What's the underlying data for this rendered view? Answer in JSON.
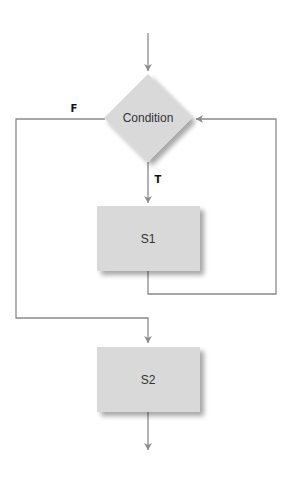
{
  "diagram": {
    "type": "flowchart",
    "title": "",
    "colors": {
      "node_fill": "#d9d9d9",
      "node_shadow": "#b8b8b8",
      "edge": "#8a8a8a",
      "node_text": "#333333",
      "edge_label": "#111111",
      "background": "#ffffff"
    },
    "nodes": [
      {
        "id": "condition",
        "shape": "diamond",
        "label": "Condition"
      },
      {
        "id": "s1",
        "shape": "rectangle",
        "label": "S1"
      },
      {
        "id": "s2",
        "shape": "rectangle",
        "label": "S2"
      }
    ],
    "edges": [
      {
        "from": "entry",
        "to": "condition",
        "label": ""
      },
      {
        "from": "condition",
        "to": "s1",
        "label": "T"
      },
      {
        "from": "s1",
        "to": "condition",
        "label": ""
      },
      {
        "from": "condition",
        "to": "s2",
        "label": "F"
      },
      {
        "from": "s2",
        "to": "exit",
        "label": ""
      }
    ]
  }
}
